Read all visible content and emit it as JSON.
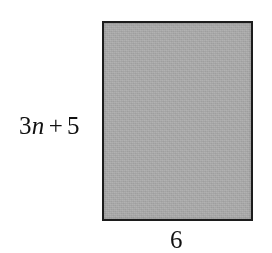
{
  "figure": {
    "type": "rectangle-with-dimension-labels",
    "background_color": "#ffffff",
    "shape": {
      "name": "rectangle",
      "fill_color": "#b2b2b2",
      "border_color": "#1c1c1c"
    },
    "labels": {
      "height": {
        "full_text": "3n + 5",
        "coefficient": "3",
        "variable": "n",
        "operator": "+",
        "constant": "5",
        "position": "left"
      },
      "width": {
        "full_text": "6",
        "position": "bottom"
      }
    }
  }
}
